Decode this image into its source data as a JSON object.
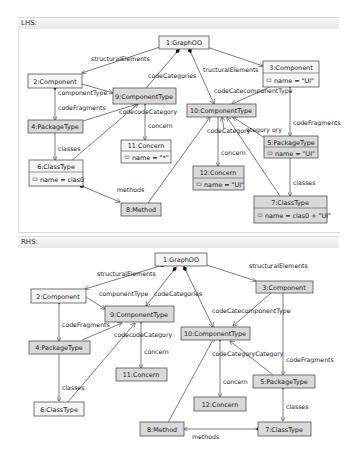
{
  "lhs": {
    "title": "LHS:",
    "nodes": {
      "n1": {
        "label": "1:GraphOO"
      },
      "n2": {
        "label": "2:Component"
      },
      "n3": {
        "label": "3:Component",
        "attr": "name = \"UI\""
      },
      "n4": {
        "label": "4:PackageType"
      },
      "n5": {
        "label": "5:PackageType",
        "attr": "name = \"UI\""
      },
      "n6": {
        "label": "6:ClassType",
        "attr": "name = clas0"
      },
      "n7": {
        "label": "7:ClassType",
        "attr": "name = clas0 + \"UI\""
      },
      "n8": {
        "label": "8:Method"
      },
      "n9": {
        "label": "9:ComponentType"
      },
      "n10": {
        "label": "10:ComponentType"
      },
      "n11": {
        "label": "11:Concern",
        "attr": "name = \"*\""
      },
      "n12": {
        "label": "12:Concern",
        "attr": "name = \"UI\""
      }
    },
    "edge_labels": {
      "structuralElements_left": "structuralElements",
      "structuralElements_right": "tructuralElements",
      "codeCategories": "codeCategories",
      "componentType_2_9": "componentType",
      "codeFragments_2_4": "codeFragments",
      "codecodeCategory_9": "codecodeCategory",
      "concern_9_11": "concern",
      "classes_4_6": "classes",
      "methods_6_8": "methods",
      "codeCate_componentType_3_10": "codeCatecomponentType",
      "codeFragments_3_5": "codeFragments",
      "codeCategory_10": "codeCategory",
      "ategory_ory_10": "ategory ory",
      "concern_10_12": "concern",
      "classes_5_7": "classes"
    }
  },
  "rhs": {
    "title": "RHS:",
    "nodes": {
      "n1": {
        "label": "1:GraphOO"
      },
      "n2": {
        "label": "2:Component"
      },
      "n3": {
        "label": "3:Component"
      },
      "n4": {
        "label": "4:PackageType"
      },
      "n5": {
        "label": "5:PackageType"
      },
      "n6": {
        "label": "6:ClassType"
      },
      "n7": {
        "label": "7:ClassType"
      },
      "n8": {
        "label": "8:Method"
      },
      "n9": {
        "label": "9:ComponentType"
      },
      "n10": {
        "label": "10:ComponentType"
      },
      "n11": {
        "label": "11:Concern"
      },
      "n12": {
        "label": "12:Concern"
      }
    },
    "edge_labels": {
      "structuralElements_left": "structuralElements",
      "structuralElements_right": "structuralElements",
      "componentType_2_9": "componentType",
      "codeCategories": "codeCategories",
      "codeFragments_2_4": "codeFragments",
      "codecodeCategory_9": "codecodeCategory",
      "concern_9_11": "concern",
      "classes_4_6": "classes",
      "codeCate_componentType_3_10": "codeCatecomponentType",
      "codeCategoryCategory_10": "codeCategoryCategory",
      "codeFragments_3_5": "codeFragments",
      "concern_10_12": "concern",
      "classes_5_7": "classes",
      "methods_7_8": "methods"
    }
  },
  "colors": {
    "new_node_fill": "#d9d9d9",
    "plain_node_fill": "#f4f4f4",
    "border": "#555555"
  }
}
